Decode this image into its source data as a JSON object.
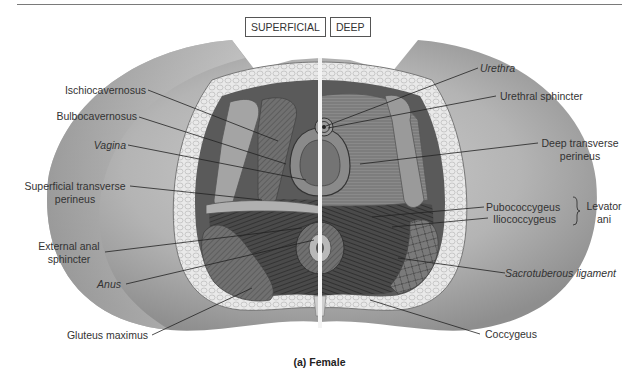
{
  "figure": {
    "view_tabs": [
      {
        "label": "SUPERFICIAL"
      },
      {
        "label": "DEEP"
      }
    ],
    "caption": "(a) Female",
    "left_labels": [
      {
        "text": "Ischiocavernosus",
        "italic": false
      },
      {
        "text": "Bulbocavernosus",
        "italic": false
      },
      {
        "text": "Vagina",
        "italic": true
      },
      {
        "text": "Superficial transverse",
        "text2": "perineus",
        "italic": false
      },
      {
        "text": "External anal",
        "text2": "sphincter",
        "italic": false
      },
      {
        "text": "Anus",
        "italic": true
      },
      {
        "text": "Gluteus maximus",
        "italic": false
      }
    ],
    "right_labels": [
      {
        "text": "Urethra",
        "italic": true
      },
      {
        "text": "Urethral sphincter",
        "italic": false
      },
      {
        "text": "Deep transverse",
        "text2": "perineus",
        "italic": false
      },
      {
        "text": "Pubococcygeus",
        "italic": false
      },
      {
        "text": "Iliococcygeus",
        "italic": false
      },
      {
        "text": "Sacrotuberous ligament",
        "italic": true
      },
      {
        "text": "Coccygeus",
        "italic": false
      }
    ],
    "group_label": {
      "text": "Levator",
      "text2": "ani",
      "groups": [
        "Pubococcygeus",
        "Iliococcygeus"
      ]
    },
    "colors": {
      "skin": "#a8a8a8",
      "skin_light": "#d4d4d4",
      "fat": "#e6e6e6",
      "muscle_dark": "#3a3a3a",
      "muscle_mid": "#6e6e6e",
      "divider": "#f4f4f4",
      "leader_line": "#222222"
    }
  }
}
